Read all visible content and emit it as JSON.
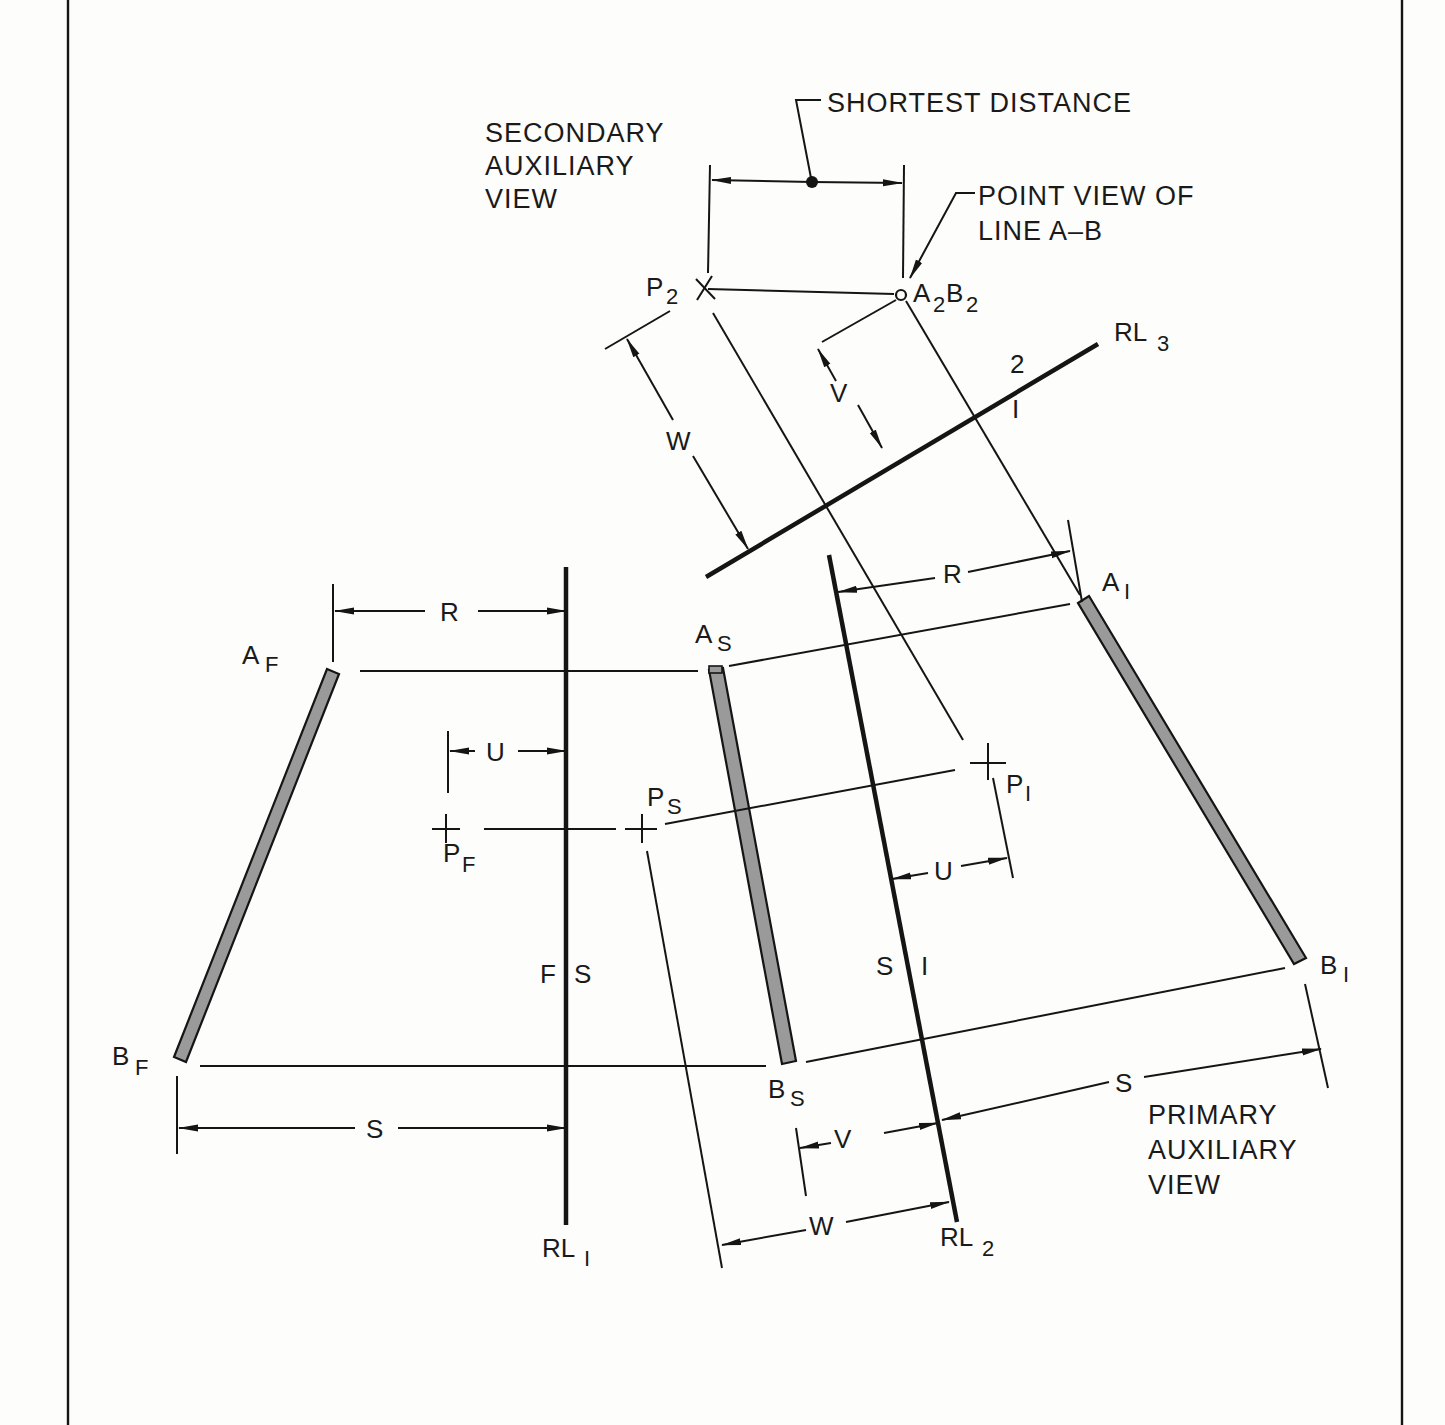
{
  "title_labels": {
    "secondary_view": [
      "SECONDARY",
      "AUXILIARY",
      "VIEW"
    ],
    "primary_view": [
      "PRIMARY",
      "AUXILIARY",
      "VIEW"
    ],
    "shortest_distance": "SHORTEST DISTANCE",
    "point_view": [
      "POINT VIEW OF",
      "LINE A–B"
    ]
  },
  "points": {
    "A_F": {
      "main": "A",
      "sub": "F"
    },
    "B_F": {
      "main": "B",
      "sub": "F"
    },
    "P_F": {
      "main": "P",
      "sub": "F"
    },
    "A_S": {
      "main": "A",
      "sub": "S"
    },
    "B_S": {
      "main": "B",
      "sub": "S"
    },
    "P_S": {
      "main": "P",
      "sub": "S"
    },
    "A_1": {
      "main": "A",
      "sub": "I"
    },
    "B_1": {
      "main": "B",
      "sub": "I"
    },
    "P_1": {
      "main": "P",
      "sub": "I"
    },
    "P_2": {
      "main": "P",
      "sub": "2"
    },
    "A2B2": {
      "a": "A",
      "a_sub": "2",
      "b": "B",
      "b_sub": "2"
    }
  },
  "reference_lines": {
    "RL1": {
      "main": "RL",
      "sub": "I",
      "left": "F",
      "right": "S"
    },
    "RL2": {
      "main": "RL",
      "sub": "2",
      "left": "S",
      "right": "I"
    },
    "RL3": {
      "main": "RL",
      "sub": "3",
      "upper": "2",
      "lower": "I"
    }
  },
  "dimensions": {
    "R_front": "R",
    "U_front": "U",
    "S_front": "S",
    "R_primary": "R",
    "U_primary": "U",
    "S_primary": "S",
    "V_side": "V",
    "W_side": "W",
    "V_secondary": "V",
    "W_secondary": "W"
  },
  "colors": {
    "ink": "#151515",
    "rod_fill": "#9a9a9a",
    "paper": "#fdfdfc"
  }
}
